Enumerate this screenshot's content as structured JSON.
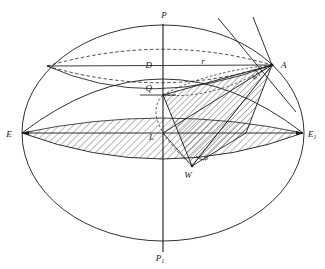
{
  "top_text": "第一节 地球的形状和大小",
  "figure": {
    "kind": "geometry-diagram",
    "labels": [
      {
        "id": "P",
        "text": "P",
        "sub": "",
        "x": 164,
        "y": 18
      },
      {
        "id": "P1",
        "text": "P",
        "sub": "1",
        "x": 160,
        "y": 261
      },
      {
        "id": "E",
        "text": "E",
        "sub": "",
        "x": 9,
        "y": 137
      },
      {
        "id": "E1",
        "text": "E",
        "sub": "1",
        "x": 308,
        "y": 137
      },
      {
        "id": "A",
        "text": "A",
        "sub": "",
        "x": 281,
        "y": 68
      },
      {
        "id": "D",
        "text": "D",
        "sub": "",
        "x": 152,
        "y": 68
      },
      {
        "id": "Q",
        "text": "Q",
        "sub": "",
        "x": 152,
        "y": 91
      },
      {
        "id": "L",
        "text": "L",
        "sub": "",
        "x": 154,
        "y": 138
      },
      {
        "id": "W",
        "text": "W",
        "sub": "",
        "x": 188,
        "y": 176
      },
      {
        "id": "r",
        "text": "r",
        "sub": "",
        "x": 203,
        "y": 64
      }
    ],
    "angles": [
      {
        "id": "omega-at-W",
        "text": "φ",
        "x": 199,
        "y": 135
      },
      {
        "id": "angle-at-A",
        "text": "φ",
        "x": 252,
        "y": 74
      }
    ],
    "points": {
      "P": [
        163,
        26
      ],
      "P1": [
        163,
        250
      ],
      "E": [
        22,
        133
      ],
      "E1": [
        303,
        133
      ],
      "L": [
        163,
        133
      ],
      "A": [
        272,
        65
      ],
      "D": [
        163,
        65
      ],
      "Q": [
        163,
        95
      ],
      "W": [
        192,
        166
      ],
      "Gleft": [
        47,
        66
      ]
    },
    "colors": {
      "stroke": "#1a1a1a",
      "hatch": "#2a2a2a",
      "background": "#ffffff",
      "dash": "#1a1a1a"
    },
    "outer_ellipse": {
      "cx": 163,
      "cy": 133,
      "rx": 141,
      "ry": 108
    },
    "upper_cap_ellipse": {
      "cx": 163,
      "cy": 133,
      "rx": 141,
      "ry": 70
    },
    "equator_band_ellipse": {
      "cx": 163,
      "cy": 133,
      "rx": 141,
      "ry": 34
    },
    "dashed_ellipse": {
      "cx": 163,
      "cy": 98,
      "rx": 117,
      "ry": 30
    }
  }
}
